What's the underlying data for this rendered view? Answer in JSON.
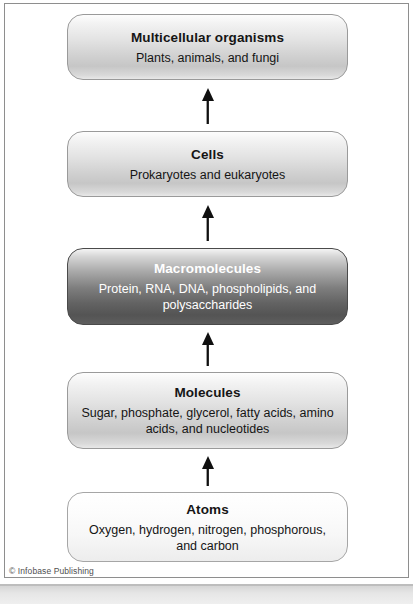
{
  "figure": {
    "type": "hierarchy-flow-diagram",
    "direction": "bottom-to-top",
    "copyright": "© Infobase Publishing",
    "arrow_icon": "up-arrow-icon",
    "levels": [
      {
        "title": "Multicellular organisms",
        "description": "Plants, animals, and fungi",
        "tint": "light"
      },
      {
        "title": "Cells",
        "description": "Prokaryotes and eukaryotes",
        "tint": "light"
      },
      {
        "title": "Macromolecules",
        "description": "Protein, RNA, DNA, phospholipids, and polysaccharides",
        "tint": "dark"
      },
      {
        "title": "Molecules",
        "description": "Sugar, phosphate, glycerol, fatty acids, amino acids, and nucleotides",
        "tint": "light"
      },
      {
        "title": "Atoms",
        "description": "Oxygen, hydrogen, nitrogen, phosphorous, and carbon",
        "tint": "palest"
      }
    ],
    "colors": {
      "frame_border": "#8e8e8e",
      "box_border": "#9a9a9a",
      "dark_box_border": "#4a4a4a",
      "arrow": "#101010",
      "text": "#151515",
      "dark_box_text": "#ffffff",
      "background": "#ffffff"
    }
  }
}
